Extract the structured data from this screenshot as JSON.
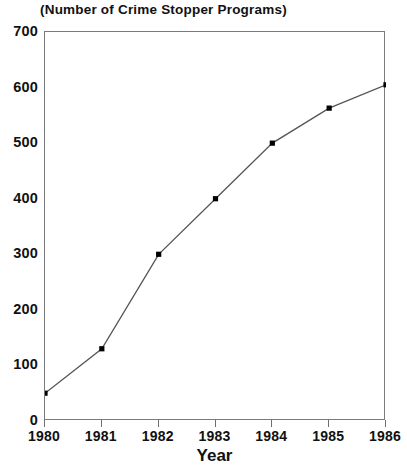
{
  "chart_data": {
    "type": "line",
    "title": "(Number of Crime Stopper Programs)",
    "xlabel": "Year",
    "ylabel": "",
    "categories": [
      "1980",
      "1981",
      "1982",
      "1983",
      "1984",
      "1985",
      "1986"
    ],
    "x": [
      1980,
      1981,
      1982,
      1983,
      1984,
      1985,
      1986
    ],
    "values": [
      50,
      130,
      300,
      400,
      500,
      563,
      605
    ],
    "series": [
      {
        "name": "Number of Crime Stopper Programs",
        "values": [
          50,
          130,
          300,
          400,
          500,
          563,
          605
        ]
      }
    ],
    "xlim": [
      1980,
      1986
    ],
    "ylim": [
      0,
      700
    ],
    "yticks": [
      0,
      100,
      200,
      300,
      400,
      500,
      600,
      700
    ],
    "ytick_labels": [
      "0",
      "100",
      "200",
      "300",
      "400",
      "500",
      "600",
      "700"
    ],
    "xticks": [
      1980,
      1981,
      1982,
      1983,
      1984,
      1985,
      1986
    ],
    "xtick_labels": [
      "1980",
      "1981",
      "1982",
      "1983",
      "1984",
      "1985",
      "1986"
    ],
    "grid": false,
    "legend": null,
    "marker": "square",
    "marker_color": "#000000",
    "line_color": "#555555",
    "axis_color": "#7b7b7b",
    "background": "#ffffff"
  }
}
